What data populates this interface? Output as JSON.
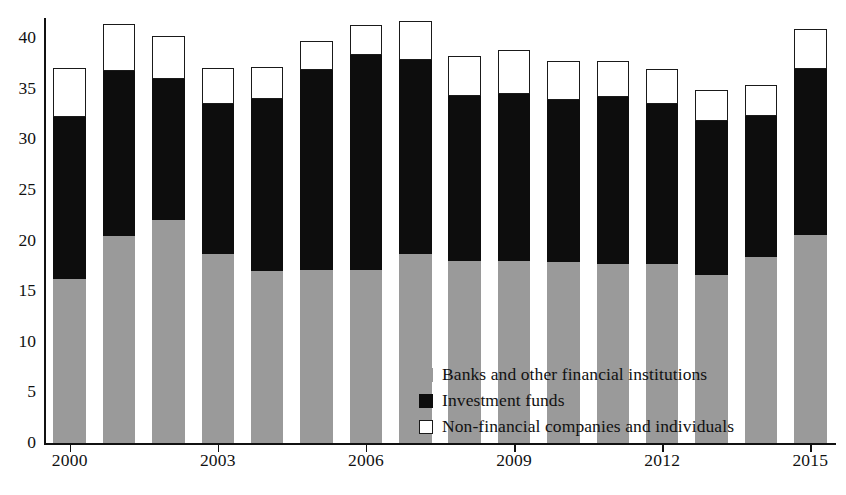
{
  "chart_data": {
    "type": "bar",
    "subtype": "stacked-bar",
    "title": "",
    "xlabel": "",
    "ylabel": "",
    "ylim": [
      0,
      42
    ],
    "yticks": [
      0,
      5,
      10,
      15,
      20,
      25,
      30,
      35,
      40
    ],
    "ytick_labels": [
      "0",
      "5",
      "10",
      "15",
      "20",
      "25",
      "30",
      "35",
      "40"
    ],
    "grid": false,
    "legend_position": "inside-bottom-right",
    "categories": [
      "2000",
      "2001",
      "2002",
      "2003",
      "2004",
      "2005",
      "2006",
      "2007",
      "2008",
      "2009",
      "2010",
      "2011",
      "2012",
      "2013",
      "2014",
      "2015"
    ],
    "xtick_labels": [
      "2000",
      "2003",
      "2006",
      "2009",
      "2012",
      "2015"
    ],
    "xtick_categories": [
      "2000",
      "2003",
      "2006",
      "2009",
      "2012",
      "2015"
    ],
    "series": [
      {
        "name": "Banks and other financial institutions",
        "color": "#9a9a9a",
        "values": [
          16.2,
          20.5,
          22.0,
          18.7,
          17.0,
          17.1,
          17.1,
          18.7,
          18.0,
          18.0,
          17.9,
          17.7,
          17.7,
          16.6,
          18.4,
          20.6
        ]
      },
      {
        "name": "Investment funds",
        "color": "#0d0d0d",
        "values": [
          16.0,
          16.3,
          14.0,
          14.8,
          17.0,
          19.8,
          21.2,
          19.2,
          16.3,
          16.5,
          16.0,
          16.5,
          15.8,
          15.2,
          13.9,
          16.4
        ]
      },
      {
        "name": "Non-financial companies and individuals",
        "color": "#ffffff",
        "values": [
          4.9,
          4.6,
          4.2,
          3.6,
          3.2,
          2.8,
          3.0,
          3.8,
          3.9,
          4.3,
          3.9,
          3.6,
          3.5,
          3.1,
          3.1,
          3.9
        ]
      }
    ],
    "totals": [
      37.1,
      41.4,
      40.2,
      37.1,
      37.2,
      39.7,
      41.3,
      41.7,
      38.2,
      38.8,
      37.8,
      37.8,
      37.0,
      34.9,
      35.4,
      40.9
    ]
  },
  "legend": {
    "items": [
      {
        "label": "Banks and other financial institutions",
        "swatch": "filled-gray"
      },
      {
        "label": "Investment funds",
        "swatch": "filled-black"
      },
      {
        "label": "Non-financial companies and individuals",
        "swatch": "outlined-white"
      }
    ]
  }
}
